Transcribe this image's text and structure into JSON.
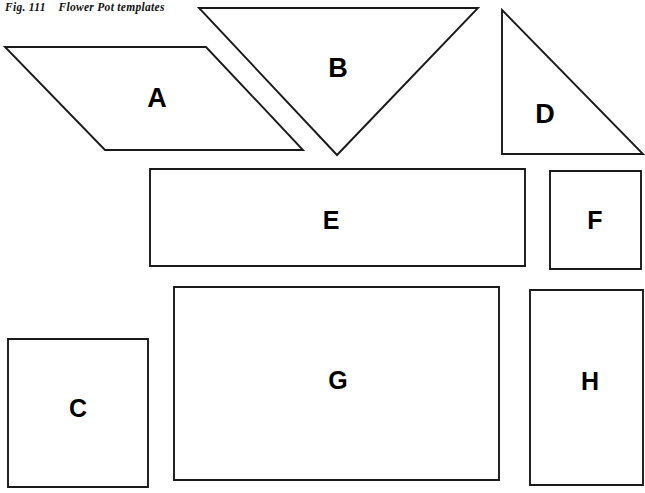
{
  "figure": {
    "caption": "Fig. 111    Flower Pot templates",
    "caption_number": "111",
    "caption_title": "Flower Pot templates",
    "background_color": "#ffffff",
    "stroke_color": "#1a1a1a",
    "label_color": "#000000"
  },
  "templates": [
    {
      "id": "A",
      "label": "A",
      "shape": "parallelogram",
      "points": "5,47 206,47 303,150 105,150",
      "label_x": 157,
      "label_y": 98,
      "label_size": 27
    },
    {
      "id": "B",
      "label": "B",
      "shape": "triangle-down",
      "points": "199,8 478,8 337,155",
      "label_x": 338,
      "label_y": 68,
      "label_size": 27
    },
    {
      "id": "D",
      "label": "D",
      "shape": "right-triangle",
      "points": "502,10 643,154 502,154",
      "label_x": 545,
      "label_y": 114,
      "label_size": 27
    },
    {
      "id": "E",
      "label": "E",
      "shape": "rectangle",
      "points": "150,169 525,169 525,266 150,266",
      "label_x": 331,
      "label_y": 220,
      "label_size": 25
    },
    {
      "id": "F",
      "label": "F",
      "shape": "rectangle",
      "points": "550,171 641,171 641,269 550,269",
      "label_x": 595,
      "label_y": 220,
      "label_size": 25
    },
    {
      "id": "C",
      "label": "C",
      "shape": "rectangle",
      "points": "8,339 148,339 148,487 8,487",
      "label_x": 78,
      "label_y": 408,
      "label_size": 25
    },
    {
      "id": "G",
      "label": "G",
      "shape": "rectangle",
      "points": "174,287 499,287 499,480 174,480",
      "label_x": 338,
      "label_y": 380,
      "label_size": 25
    },
    {
      "id": "H",
      "label": "H",
      "shape": "rectangle",
      "points": "530,290 643,290 643,485 530,485",
      "label_x": 590,
      "label_y": 381,
      "label_size": 25
    }
  ]
}
